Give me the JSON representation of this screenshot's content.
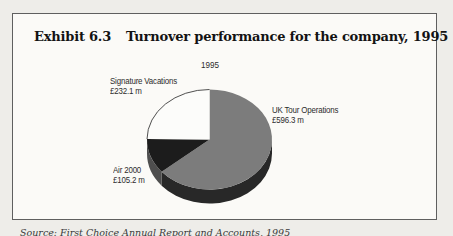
{
  "page": {
    "background": "#eeede9",
    "box_background": "#fbfaf7",
    "box_border_color": "#5f5f5f"
  },
  "exhibit": {
    "label": "Exhibit 6.3",
    "title": "Turnover performance for the company, 1995"
  },
  "chart_data": {
    "type": "pie",
    "title": "1995",
    "unit": "£ million",
    "start_angle_deg": -90,
    "clockwise": true,
    "total": 933.6,
    "slices": [
      {
        "label": "UK Tour Operations",
        "value": 596.3,
        "value_label": "£596.3 m",
        "color": "#7c7c7c",
        "side_color": "#282828"
      },
      {
        "label": "Air 2000",
        "value": 105.2,
        "value_label": "£105.2 m",
        "color": "#1c1c1c",
        "side_color": "#4e4e4e"
      },
      {
        "label": "Signature Vacations",
        "value": 232.1,
        "value_label": "£232.1 m",
        "color": "#fcfcfa",
        "side_color": "#3c3c3c",
        "stroke": "#3c3c3c"
      }
    ],
    "style": "3d-pie"
  },
  "source_line": "Source: First Choice Annual Report and Accounts, 1995"
}
